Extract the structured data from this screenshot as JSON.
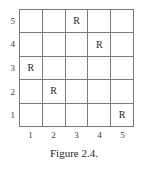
{
  "figure": {
    "caption": "Figure 2.4.",
    "mark_symbol": "R"
  },
  "axes": {
    "column_labels": [
      "1",
      "2",
      "3",
      "4",
      "5"
    ],
    "row_labels": [
      "5",
      "4",
      "3",
      "2",
      "1"
    ]
  },
  "chart_data": {
    "type": "heatmap",
    "title": "Figure 2.4.",
    "xlabel": "",
    "ylabel": "",
    "grid": true,
    "legend": "none",
    "x": [
      1,
      2,
      3,
      4,
      5
    ],
    "y": [
      1,
      2,
      3,
      4,
      5
    ],
    "xlim": [
      1,
      5
    ],
    "ylim": [
      1,
      5
    ],
    "xtick_labels": [
      "1",
      "2",
      "3",
      "4",
      "5"
    ],
    "ytick_labels": [
      "1",
      "2",
      "3",
      "4",
      "5"
    ],
    "cell_symbol": "R",
    "marked_cells": [
      {
        "column": 3,
        "row": 5,
        "label": "R"
      },
      {
        "column": 4,
        "row": 4,
        "label": "R"
      },
      {
        "column": 1,
        "row": 3,
        "label": "R"
      },
      {
        "column": 2,
        "row": 2,
        "label": "R"
      },
      {
        "column": 5,
        "row": 1,
        "label": "R"
      }
    ],
    "matrix_top_to_bottom": [
      [
        "",
        "",
        "R",
        "",
        ""
      ],
      [
        "",
        "",
        "",
        "R",
        ""
      ],
      [
        "R",
        "",
        "",
        "",
        ""
      ],
      [
        "",
        "R",
        "",
        "",
        ""
      ],
      [
        "",
        "",
        "",
        "",
        "R"
      ]
    ],
    "colors": {
      "background": "#ffffff",
      "grid_line": "#7b7b7b",
      "text": "#262626"
    }
  }
}
